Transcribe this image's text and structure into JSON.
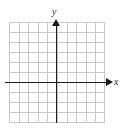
{
  "figure": {
    "kind": "blank-cartesian-coordinate-grid",
    "background_color": "#ffffff"
  },
  "axes": {
    "x": {
      "label": "x",
      "arrow_direction": "right",
      "color": "#1a1a1a"
    },
    "y": {
      "label": "y",
      "arrow_direction": "up",
      "color": "#1a1a1a"
    }
  },
  "grid": {
    "columns": 10,
    "rows": 10,
    "line_color": "#c8c8c8",
    "tick_labels": [],
    "origin_column_index": 5,
    "origin_row_index": 6
  },
  "chart_data": {
    "type": "scatter",
    "title": "",
    "subtitle": "",
    "xlabel": "x",
    "ylabel": "y",
    "x": [],
    "y": [],
    "series": [],
    "annotations": [],
    "legend": [],
    "legend_position": "none",
    "grid": true,
    "xlim": [
      -5,
      5
    ],
    "ylim": [
      -4,
      6
    ],
    "xticks": [],
    "yticks": []
  }
}
